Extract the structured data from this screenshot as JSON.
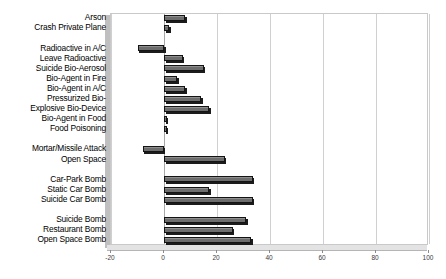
{
  "chart_data": {
    "type": "bar",
    "orientation": "horizontal",
    "title": "",
    "subtitle": "",
    "xlabel": "",
    "ylabel": "",
    "xlim": [
      -20,
      100
    ],
    "xticks": [
      -20,
      0,
      20,
      40,
      60,
      80,
      100
    ],
    "xtick_labels": [
      "-20",
      "0",
      "20",
      "40",
      "60",
      "80",
      "100"
    ],
    "grid": true,
    "grid_axis": "x",
    "legend": false,
    "legend_position": "none",
    "series_name": "",
    "bar_color": "#6d6d6d",
    "bar_edge_color": "#141414",
    "categories": [
      "Arson",
      "Crash Private Plane",
      "",
      "Radioactive in A/C",
      "Leave Radioactive",
      "Suicide Bio-Aerosol",
      "Bio-Agent in Fire",
      "Bio-Agent in A/C",
      "Pressurized Bio-",
      "Explosive Bio-Device",
      "Bio-Agent in Food",
      "Food Poisoning",
      "",
      "Mortar/Missile Attack",
      "Open Space",
      "",
      "Car-Park Bomb",
      "Static Car Bomb",
      "Suicide Car Bomb",
      "",
      "Suicide Bomb",
      "Restaurant Bomb",
      "Open Space Bomb"
    ],
    "values": [
      8,
      2,
      null,
      -10,
      7,
      15,
      5,
      8,
      14,
      17,
      1,
      1,
      null,
      -8,
      23,
      null,
      33.5,
      17,
      33.5,
      null,
      31,
      26,
      33
    ]
  }
}
